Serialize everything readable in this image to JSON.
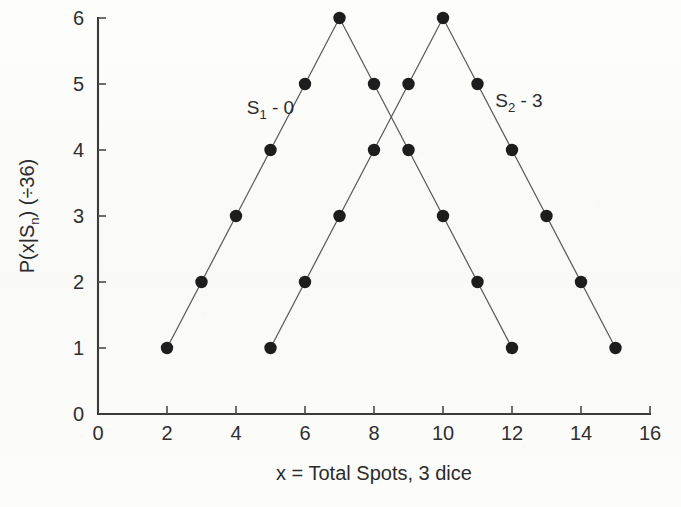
{
  "chart_data": {
    "type": "line",
    "title": "",
    "subtitle": "",
    "xlabel": "x = Total Spots, 3 dice",
    "ylabel": "P(x|Sₙ) (÷36)",
    "xlim": [
      0,
      16
    ],
    "ylim": [
      0,
      6
    ],
    "xticks": [
      0,
      2,
      4,
      6,
      8,
      10,
      12,
      14,
      16
    ],
    "yticks": [
      0,
      1,
      2,
      3,
      4,
      5,
      6
    ],
    "xtick_labels": [
      "0",
      "2",
      "4",
      "6",
      "8",
      "10",
      "12",
      "14",
      "16"
    ],
    "ytick_labels": [
      "0",
      "1",
      "2",
      "3",
      "4",
      "5",
      "6"
    ],
    "grid": false,
    "legend_position": "inside-plot-annotations",
    "marker": "filled-circle",
    "marker_color": "#1d1d1d",
    "line_color": "#5a5a5a",
    "series": [
      {
        "name": "S₁ - 0",
        "label_main": "S",
        "label_sub": "1",
        "label_tail": " - 0",
        "annotation_x": 5.0,
        "annotation_y": 4.55,
        "x": [
          2,
          3,
          4,
          5,
          6,
          7,
          8,
          9,
          10,
          11,
          12
        ],
        "values": [
          1,
          2,
          3,
          4,
          5,
          6,
          5,
          4,
          3,
          2,
          1
        ]
      },
      {
        "name": "S₂ - 3",
        "label_main": "S",
        "label_sub": "2",
        "label_tail": " - 3",
        "annotation_x": 12.2,
        "annotation_y": 4.65,
        "x": [
          5,
          6,
          7,
          8,
          9,
          10,
          11,
          12,
          13,
          14,
          15
        ],
        "values": [
          1,
          2,
          3,
          4,
          5,
          6,
          5,
          4,
          3,
          2,
          1
        ]
      }
    ]
  },
  "figure": {
    "background_color": "#fbfbfa",
    "axis_color": "#3b3b3b"
  }
}
